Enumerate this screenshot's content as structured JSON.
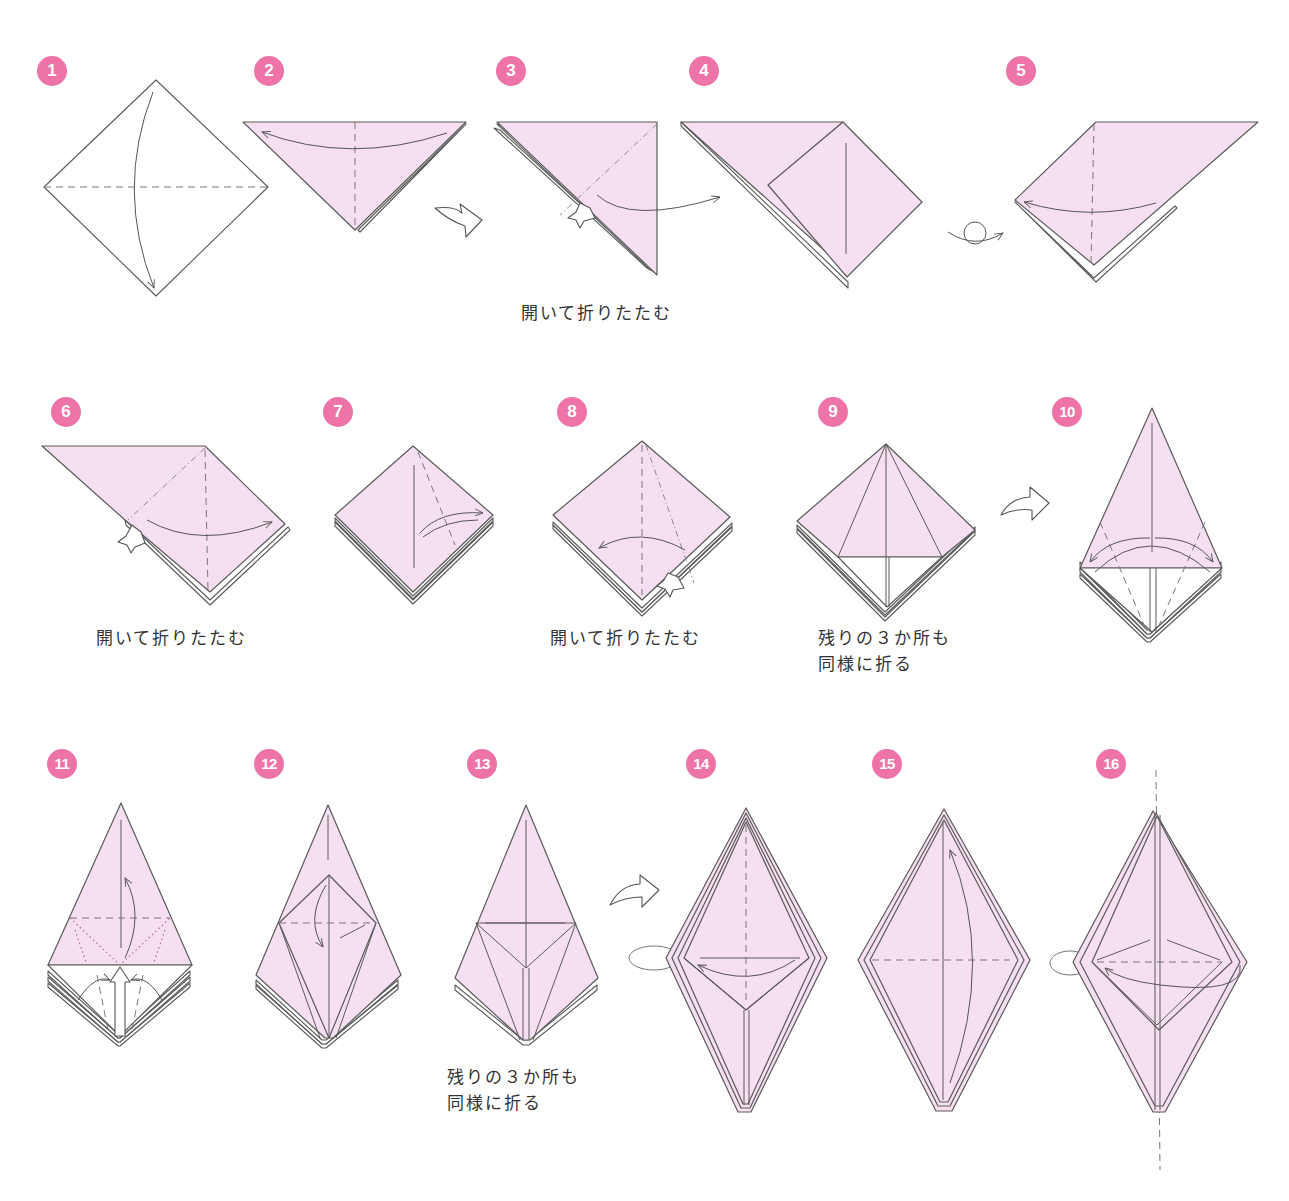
{
  "colors": {
    "badge": "#ee74a8",
    "paper_color_side": "#f6dff0",
    "paper_white_side": "#ffffff",
    "line": "#5a5a5a"
  },
  "steps": [
    {
      "number": "1",
      "caption": "",
      "icons": [
        "valley-fold-line",
        "fold-arrow"
      ]
    },
    {
      "number": "2",
      "caption": "",
      "icons": [
        "valley-fold-line",
        "fold-arrow"
      ]
    },
    {
      "number": "3",
      "caption": "開いて折りたたむ",
      "icons": [
        "mountain-fold-line",
        "push-arrow",
        "fold-arrow"
      ]
    },
    {
      "number": "4",
      "caption": "",
      "icons": []
    },
    {
      "number": "5",
      "caption": "",
      "icons": [
        "valley-fold-line",
        "fold-arrow"
      ]
    },
    {
      "number": "6",
      "caption": "開いて折りたたむ",
      "icons": [
        "valley-fold-line",
        "push-arrow",
        "fold-arrow"
      ]
    },
    {
      "number": "7",
      "caption": "",
      "icons": [
        "valley-fold-line",
        "fold-unfold-arrow"
      ]
    },
    {
      "number": "8",
      "caption": "開いて折りたたむ",
      "icons": [
        "valley-fold-line",
        "push-arrow",
        "fold-arrow"
      ]
    },
    {
      "number": "9",
      "caption": "残りの３か所も\n同様に折る",
      "icons": []
    },
    {
      "number": "10",
      "caption": "",
      "icons": [
        "valley-fold-line",
        "fold-unfold-arrow"
      ]
    },
    {
      "number": "11",
      "caption": "",
      "icons": [
        "valley-fold-line",
        "dotted-fold-line",
        "push-arrow",
        "fold-arrow"
      ]
    },
    {
      "number": "12",
      "caption": "",
      "icons": [
        "valley-fold-line",
        "fold-arrow"
      ]
    },
    {
      "number": "13",
      "caption": "残りの３か所も\n同様に折る",
      "icons": []
    },
    {
      "number": "14",
      "caption": "",
      "icons": [
        "turn-over-icon",
        "valley-fold-line",
        "fold-arrow"
      ]
    },
    {
      "number": "15",
      "caption": "",
      "icons": [
        "valley-fold-line",
        "fold-arrow"
      ]
    },
    {
      "number": "16",
      "caption": "",
      "icons": [
        "turn-over-icon",
        "valley-fold-line",
        "fold-arrow",
        "axis-line"
      ]
    }
  ],
  "transitions": [
    {
      "between": "2-3",
      "icon": "next-step-arrow"
    },
    {
      "between": "4-5",
      "icon": "turn-over-icon"
    },
    {
      "between": "9-10",
      "icon": "next-step-arrow"
    },
    {
      "between": "13-14",
      "icon": "next-step-arrow"
    }
  ]
}
